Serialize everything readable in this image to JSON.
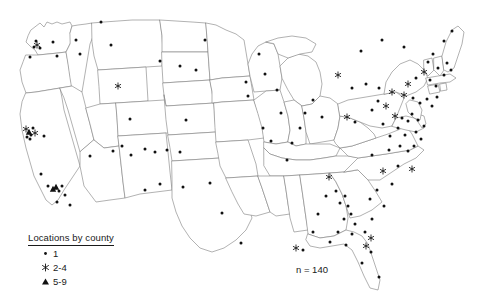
{
  "figure": {
    "type": "map",
    "region": "United States (contiguous 48 states)",
    "projection_hint": "albers-usa",
    "background_color": "#ffffff",
    "boundary_color": "#7d7d7d",
    "marker_color": "#111111"
  },
  "legend": {
    "title": "Locations by county",
    "entries": [
      {
        "symbol": "dot",
        "label": "1"
      },
      {
        "symbol": "asterisk",
        "label": "2-4"
      },
      {
        "symbol": "triangle",
        "label": "5-9"
      }
    ]
  },
  "annotations": {
    "sample_size": "n = 140"
  },
  "chart_data": {
    "type": "scatter",
    "title": "",
    "xlabel": "",
    "ylabel": "",
    "legend_position": "bottom-left",
    "grid": false,
    "classes": [
      {
        "symbol": "dot",
        "label": "1",
        "count_per_marker": 1
      },
      {
        "symbol": "asterisk",
        "label": "2-4",
        "count_per_marker": 3
      },
      {
        "symbol": "triangle",
        "label": "5-9",
        "count_per_marker": 7
      }
    ],
    "total_label": "n = 140",
    "points": [
      {
        "x": 37,
        "y": 45,
        "symbol": "asterisk"
      },
      {
        "x": 34,
        "y": 47,
        "symbol": "dot"
      },
      {
        "x": 40,
        "y": 48,
        "symbol": "dot"
      },
      {
        "x": 36,
        "y": 41,
        "symbol": "dot"
      },
      {
        "x": 30,
        "y": 57,
        "symbol": "dot"
      },
      {
        "x": 53,
        "y": 42,
        "symbol": "dot"
      },
      {
        "x": 57,
        "y": 56,
        "symbol": "dot"
      },
      {
        "x": 76,
        "y": 40,
        "symbol": "dot"
      },
      {
        "x": 80,
        "y": 54,
        "symbol": "dot"
      },
      {
        "x": 111,
        "y": 45,
        "symbol": "dot"
      },
      {
        "x": 101,
        "y": 22,
        "symbol": "dot"
      },
      {
        "x": 118,
        "y": 86,
        "symbol": "asterisk"
      },
      {
        "x": 130,
        "y": 119,
        "symbol": "dot"
      },
      {
        "x": 26,
        "y": 129,
        "symbol": "asterisk"
      },
      {
        "x": 29,
        "y": 132,
        "symbol": "triangle"
      },
      {
        "x": 31,
        "y": 135,
        "symbol": "dot"
      },
      {
        "x": 33,
        "y": 128,
        "symbol": "dot"
      },
      {
        "x": 35,
        "y": 133,
        "symbol": "asterisk"
      },
      {
        "x": 30,
        "y": 139,
        "symbol": "dot"
      },
      {
        "x": 27,
        "y": 137,
        "symbol": "dot"
      },
      {
        "x": 44,
        "y": 136,
        "symbol": "dot"
      },
      {
        "x": 41,
        "y": 174,
        "symbol": "dot"
      },
      {
        "x": 48,
        "y": 186,
        "symbol": "dot"
      },
      {
        "x": 53,
        "y": 189,
        "symbol": "triangle"
      },
      {
        "x": 56,
        "y": 187,
        "symbol": "triangle"
      },
      {
        "x": 59,
        "y": 191,
        "symbol": "dot"
      },
      {
        "x": 62,
        "y": 186,
        "symbol": "dot"
      },
      {
        "x": 65,
        "y": 195,
        "symbol": "dot"
      },
      {
        "x": 57,
        "y": 202,
        "symbol": "dot"
      },
      {
        "x": 70,
        "y": 205,
        "symbol": "dot"
      },
      {
        "x": 90,
        "y": 156,
        "symbol": "dot"
      },
      {
        "x": 113,
        "y": 151,
        "symbol": "dot"
      },
      {
        "x": 122,
        "y": 146,
        "symbol": "dot"
      },
      {
        "x": 131,
        "y": 155,
        "symbol": "dot"
      },
      {
        "x": 145,
        "y": 149,
        "symbol": "dot"
      },
      {
        "x": 155,
        "y": 152,
        "symbol": "dot"
      },
      {
        "x": 167,
        "y": 150,
        "symbol": "dot"
      },
      {
        "x": 180,
        "y": 152,
        "symbol": "dot"
      },
      {
        "x": 145,
        "y": 190,
        "symbol": "dot"
      },
      {
        "x": 160,
        "y": 184,
        "symbol": "dot"
      },
      {
        "x": 183,
        "y": 187,
        "symbol": "dot"
      },
      {
        "x": 160,
        "y": 61,
        "symbol": "dot"
      },
      {
        "x": 180,
        "y": 66,
        "symbol": "dot"
      },
      {
        "x": 196,
        "y": 70,
        "symbol": "dot"
      },
      {
        "x": 205,
        "y": 40,
        "symbol": "dot"
      },
      {
        "x": 186,
        "y": 120,
        "symbol": "dot"
      },
      {
        "x": 210,
        "y": 183,
        "symbol": "dot"
      },
      {
        "x": 222,
        "y": 213,
        "symbol": "dot"
      },
      {
        "x": 241,
        "y": 243,
        "symbol": "dot"
      },
      {
        "x": 246,
        "y": 82,
        "symbol": "dot"
      },
      {
        "x": 248,
        "y": 96,
        "symbol": "dot"
      },
      {
        "x": 259,
        "y": 54,
        "symbol": "dot"
      },
      {
        "x": 265,
        "y": 74,
        "symbol": "dot"
      },
      {
        "x": 277,
        "y": 90,
        "symbol": "dot"
      },
      {
        "x": 281,
        "y": 113,
        "symbol": "dot"
      },
      {
        "x": 263,
        "y": 128,
        "symbol": "dot"
      },
      {
        "x": 271,
        "y": 141,
        "symbol": "dot"
      },
      {
        "x": 287,
        "y": 160,
        "symbol": "dot"
      },
      {
        "x": 292,
        "y": 143,
        "symbol": "dot"
      },
      {
        "x": 300,
        "y": 128,
        "symbol": "dot"
      },
      {
        "x": 305,
        "y": 113,
        "symbol": "dot"
      },
      {
        "x": 313,
        "y": 100,
        "symbol": "dot"
      },
      {
        "x": 322,
        "y": 117,
        "symbol": "dot"
      },
      {
        "x": 329,
        "y": 177,
        "symbol": "asterisk"
      },
      {
        "x": 326,
        "y": 196,
        "symbol": "dot"
      },
      {
        "x": 336,
        "y": 191,
        "symbol": "dot"
      },
      {
        "x": 340,
        "y": 203,
        "symbol": "dot"
      },
      {
        "x": 345,
        "y": 196,
        "symbol": "dot"
      },
      {
        "x": 348,
        "y": 206,
        "symbol": "dot"
      },
      {
        "x": 351,
        "y": 214,
        "symbol": "dot"
      },
      {
        "x": 344,
        "y": 219,
        "symbol": "dot"
      },
      {
        "x": 355,
        "y": 224,
        "symbol": "dot"
      },
      {
        "x": 352,
        "y": 234,
        "symbol": "dot"
      },
      {
        "x": 338,
        "y": 232,
        "symbol": "dot"
      },
      {
        "x": 318,
        "y": 214,
        "symbol": "dot"
      },
      {
        "x": 313,
        "y": 232,
        "symbol": "dot"
      },
      {
        "x": 330,
        "y": 242,
        "symbol": "dot"
      },
      {
        "x": 346,
        "y": 245,
        "symbol": "dot"
      },
      {
        "x": 296,
        "y": 248,
        "symbol": "asterisk"
      },
      {
        "x": 303,
        "y": 250,
        "symbol": "dot"
      },
      {
        "x": 365,
        "y": 232,
        "symbol": "dot"
      },
      {
        "x": 371,
        "y": 238,
        "symbol": "asterisk"
      },
      {
        "x": 366,
        "y": 246,
        "symbol": "asterisk"
      },
      {
        "x": 371,
        "y": 252,
        "symbol": "dot"
      },
      {
        "x": 362,
        "y": 263,
        "symbol": "dot"
      },
      {
        "x": 379,
        "y": 277,
        "symbol": "dot"
      },
      {
        "x": 372,
        "y": 219,
        "symbol": "dot"
      },
      {
        "x": 384,
        "y": 206,
        "symbol": "dot"
      },
      {
        "x": 392,
        "y": 184,
        "symbol": "dot"
      },
      {
        "x": 377,
        "y": 190,
        "symbol": "dot"
      },
      {
        "x": 370,
        "y": 199,
        "symbol": "dot"
      },
      {
        "x": 383,
        "y": 171,
        "symbol": "asterisk"
      },
      {
        "x": 398,
        "y": 166,
        "symbol": "dot"
      },
      {
        "x": 412,
        "y": 169,
        "symbol": "asterisk"
      },
      {
        "x": 372,
        "y": 155,
        "symbol": "dot"
      },
      {
        "x": 389,
        "y": 150,
        "symbol": "dot"
      },
      {
        "x": 400,
        "y": 146,
        "symbol": "dot"
      },
      {
        "x": 408,
        "y": 151,
        "symbol": "dot"
      },
      {
        "x": 414,
        "y": 146,
        "symbol": "dot"
      },
      {
        "x": 405,
        "y": 135,
        "symbol": "dot"
      },
      {
        "x": 416,
        "y": 132,
        "symbol": "dot"
      },
      {
        "x": 421,
        "y": 139,
        "symbol": "dot"
      },
      {
        "x": 398,
        "y": 128,
        "symbol": "dot"
      },
      {
        "x": 390,
        "y": 136,
        "symbol": "dot"
      },
      {
        "x": 383,
        "y": 124,
        "symbol": "dot"
      },
      {
        "x": 395,
        "y": 116,
        "symbol": "asterisk"
      },
      {
        "x": 402,
        "y": 118,
        "symbol": "dot"
      },
      {
        "x": 408,
        "y": 121,
        "symbol": "dot"
      },
      {
        "x": 412,
        "y": 114,
        "symbol": "dot"
      },
      {
        "x": 418,
        "y": 120,
        "symbol": "dot"
      },
      {
        "x": 424,
        "y": 126,
        "symbol": "dot"
      },
      {
        "x": 372,
        "y": 110,
        "symbol": "dot"
      },
      {
        "x": 378,
        "y": 101,
        "symbol": "dot"
      },
      {
        "x": 386,
        "y": 106,
        "symbol": "asterisk"
      },
      {
        "x": 347,
        "y": 117,
        "symbol": "asterisk"
      },
      {
        "x": 355,
        "y": 122,
        "symbol": "dot"
      },
      {
        "x": 338,
        "y": 75,
        "symbol": "asterisk"
      },
      {
        "x": 352,
        "y": 88,
        "symbol": "dot"
      },
      {
        "x": 366,
        "y": 84,
        "symbol": "dot"
      },
      {
        "x": 379,
        "y": 88,
        "symbol": "dot"
      },
      {
        "x": 392,
        "y": 92,
        "symbol": "asterisk"
      },
      {
        "x": 404,
        "y": 95,
        "symbol": "asterisk"
      },
      {
        "x": 413,
        "y": 98,
        "symbol": "dot"
      },
      {
        "x": 420,
        "y": 103,
        "symbol": "dot"
      },
      {
        "x": 427,
        "y": 99,
        "symbol": "dot"
      },
      {
        "x": 432,
        "y": 106,
        "symbol": "dot"
      },
      {
        "x": 437,
        "y": 97,
        "symbol": "dot"
      },
      {
        "x": 408,
        "y": 84,
        "symbol": "asterisk"
      },
      {
        "x": 416,
        "y": 78,
        "symbol": "dot"
      },
      {
        "x": 424,
        "y": 72,
        "symbol": "asterisk"
      },
      {
        "x": 430,
        "y": 80,
        "symbol": "dot"
      },
      {
        "x": 436,
        "y": 86,
        "symbol": "dot"
      },
      {
        "x": 428,
        "y": 62,
        "symbol": "dot"
      },
      {
        "x": 433,
        "y": 54,
        "symbol": "dot"
      },
      {
        "x": 438,
        "y": 68,
        "symbol": "dot"
      },
      {
        "x": 444,
        "y": 75,
        "symbol": "dot"
      },
      {
        "x": 447,
        "y": 63,
        "symbol": "dot"
      },
      {
        "x": 451,
        "y": 70,
        "symbol": "dot"
      },
      {
        "x": 444,
        "y": 41,
        "symbol": "dot"
      },
      {
        "x": 452,
        "y": 31,
        "symbol": "dot"
      },
      {
        "x": 404,
        "y": 47,
        "symbol": "dot"
      },
      {
        "x": 382,
        "y": 40,
        "symbol": "dot"
      },
      {
        "x": 361,
        "y": 51,
        "symbol": "dot"
      }
    ]
  }
}
